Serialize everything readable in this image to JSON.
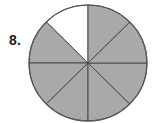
{
  "figure": {
    "problem_number": "8.",
    "caption": "",
    "background_color": "#ffffff"
  },
  "chart_data": {
    "type": "pie",
    "title": "",
    "subtitle": "",
    "xlabel": "",
    "ylabel": "",
    "legend": [],
    "legend_position": "none",
    "grid": false,
    "total_sectors": 8,
    "shaded_sectors": 7,
    "unshaded_sectors": 1,
    "fraction_shaded": "7/8",
    "fraction_unshaded": "1/8",
    "sector_angle_degrees": 45,
    "categories": [
      "sector-1",
      "sector-2",
      "sector-3",
      "sector-4",
      "sector-5",
      "sector-6",
      "sector-7",
      "sector-8"
    ],
    "values": [
      45,
      45,
      45,
      45,
      45,
      45,
      45,
      45
    ],
    "sectors": [
      {
        "index": 1,
        "start_deg": 90,
        "end_deg": 135,
        "shaded": false,
        "fill": "#ffffff"
      },
      {
        "index": 2,
        "start_deg": 135,
        "end_deg": 180,
        "shaded": true,
        "fill": "#a9a9a9"
      },
      {
        "index": 3,
        "start_deg": 180,
        "end_deg": 225,
        "shaded": true,
        "fill": "#a9a9a9"
      },
      {
        "index": 4,
        "start_deg": 225,
        "end_deg": 270,
        "shaded": true,
        "fill": "#a9a9a9"
      },
      {
        "index": 5,
        "start_deg": 270,
        "end_deg": 315,
        "shaded": true,
        "fill": "#a9a9a9"
      },
      {
        "index": 6,
        "start_deg": 315,
        "end_deg": 360,
        "shaded": true,
        "fill": "#a9a9a9"
      },
      {
        "index": 7,
        "start_deg": 0,
        "end_deg": 45,
        "shaded": true,
        "fill": "#a9a9a9"
      },
      {
        "index": 8,
        "start_deg": 45,
        "end_deg": 90,
        "shaded": true,
        "fill": "#a9a9a9"
      }
    ],
    "colors": {
      "shaded_fill": "#a9a9a9",
      "unshaded_fill": "#ffffff",
      "outline": "#565656",
      "divider": "#4a4a4a"
    },
    "geometry": {
      "center_x": 88,
      "center_y": 63,
      "radius_x": 59,
      "radius_y": 58,
      "stroke_width": 1
    }
  }
}
